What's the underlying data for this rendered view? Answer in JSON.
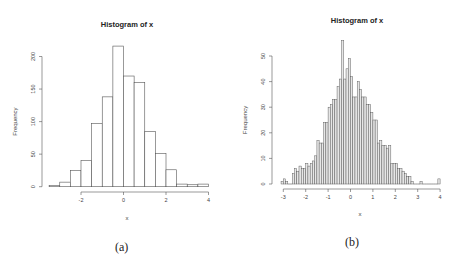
{
  "chart_data": [
    {
      "type": "bar",
      "subtype": "histogram",
      "title": "Histogram of x",
      "xlabel": "x",
      "ylabel": "Frequency",
      "bin_width": 0.5,
      "bin_edges": [
        -3.5,
        -3.0,
        -2.5,
        -2.0,
        -1.5,
        -1.0,
        -0.5,
        0.0,
        0.5,
        1.0,
        1.5,
        2.0,
        2.5,
        3.0,
        3.5,
        4.0
      ],
      "values": [
        2,
        7,
        25,
        40,
        97,
        138,
        216,
        170,
        160,
        85,
        51,
        26,
        4,
        3,
        4
      ],
      "xticks": [
        -2,
        0,
        2,
        4
      ],
      "yticks": [
        0,
        50,
        100,
        150,
        200
      ],
      "xlim": [
        -3.5,
        4
      ],
      "ylim": [
        0,
        216
      ],
      "grid": false,
      "caption": "(a)"
    },
    {
      "type": "bar",
      "subtype": "histogram",
      "title": "Histogram of x",
      "xlabel": "x",
      "ylabel": "Frequency",
      "bin_width": 0.1,
      "bin_start": -3.1,
      "values": [
        1,
        2,
        1,
        0,
        0,
        4,
        6,
        5,
        7,
        6,
        6,
        8,
        7,
        8,
        9,
        11,
        17,
        16,
        16,
        24,
        24,
        30,
        31,
        33,
        33,
        38,
        41,
        56,
        41,
        45,
        49,
        42,
        34,
        34,
        40,
        37,
        34,
        34,
        31,
        31,
        28,
        25,
        25,
        16,
        17,
        15,
        15,
        14,
        15,
        8,
        8,
        8,
        6,
        6,
        5,
        4,
        3,
        3,
        1,
        0,
        0,
        0,
        1,
        0,
        0,
        0,
        0,
        0,
        0,
        0,
        2
      ],
      "xticks": [
        -3,
        -2,
        -1,
        0,
        1,
        2,
        3,
        4
      ],
      "yticks": [
        0,
        10,
        20,
        30,
        40,
        50
      ],
      "xlim": [
        -3.1,
        4
      ],
      "ylim": [
        0,
        56
      ],
      "grid": false,
      "caption": "(b)"
    }
  ],
  "captions": {
    "a": "(a)",
    "b": "(b)"
  }
}
